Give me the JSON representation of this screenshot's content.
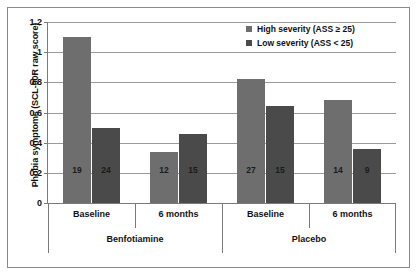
{
  "chart_data": {
    "type": "bar",
    "title": "",
    "xlabel": "",
    "ylabel": "Phobia symptoms  (SCL-90R raw score)",
    "ylim": [
      0,
      1.2
    ],
    "ytick_labels": [
      "0",
      "0.2",
      "0.4",
      "0.6",
      "0.8",
      "1",
      "1.2"
    ],
    "ytick_values": [
      0,
      0.2,
      0.4,
      0.6,
      0.8,
      1.0,
      1.2
    ],
    "grid": true,
    "legend_position": "top-right",
    "group_labels": [
      "Benfotiamine",
      "Placebo"
    ],
    "categories": [
      "Baseline",
      "6 months",
      "Baseline",
      "6 months"
    ],
    "series": [
      {
        "name": "High severity (ASS ≥ 25)",
        "color": "#6e6e6e",
        "values": [
          1.1,
          0.34,
          0.82,
          0.68
        ],
        "point_labels": [
          "19",
          "12",
          "27",
          "14"
        ]
      },
      {
        "name": "Low severity (ASS < 25)",
        "color": "#4a4a4a",
        "values": [
          0.5,
          0.46,
          0.64,
          0.36
        ],
        "point_labels": [
          "24",
          "15",
          "15",
          "9"
        ]
      }
    ]
  },
  "legend": {
    "items": [
      {
        "label": "High severity (ASS ≥ 25)",
        "color": "#6e6e6e"
      },
      {
        "label": "Low severity (ASS < 25)",
        "color": "#4a4a4a"
      }
    ]
  }
}
